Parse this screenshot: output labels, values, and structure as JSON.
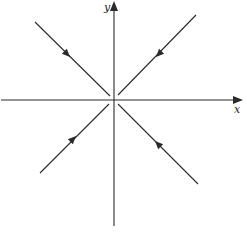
{
  "diagram": {
    "type": "phase-portrait",
    "axes": {
      "x_label": "x",
      "y_label": "y",
      "origin": [
        114,
        100
      ],
      "x_axis": {
        "from": [
          1,
          100
        ],
        "to": [
          242,
          100
        ]
      },
      "y_axis": {
        "from": [
          114,
          226
        ],
        "to": [
          114,
          2
        ]
      }
    },
    "trajectories": [
      {
        "name": "upper-left",
        "from": [
          35,
          22
        ],
        "to": [
          110,
          96
        ],
        "arrow_at": [
          68,
          55
        ],
        "direction": "toward-origin"
      },
      {
        "name": "upper-right",
        "from": [
          196,
          15
        ],
        "to": [
          118,
          95
        ],
        "arrow_at": [
          158,
          55
        ],
        "direction": "toward-origin"
      },
      {
        "name": "lower-left",
        "from": [
          40,
          173
        ],
        "to": [
          109,
          104
        ],
        "arrow_at": [
          74,
          138
        ],
        "direction": "toward-origin"
      },
      {
        "name": "lower-right",
        "from": [
          198,
          184
        ],
        "to": [
          118,
          104
        ],
        "arrow_at": [
          157,
          143
        ],
        "direction": "toward-origin"
      }
    ],
    "colors": {
      "stroke": "#2a2a2a",
      "background": "#ffffff"
    }
  }
}
